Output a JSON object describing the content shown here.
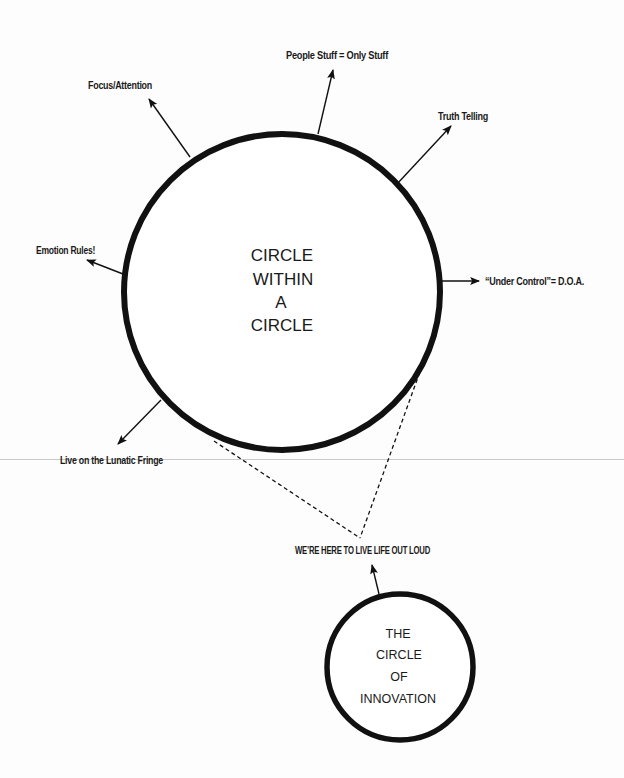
{
  "diagram": {
    "colors": {
      "ink": "#111111",
      "background": "#fdfdfd",
      "scan_line": "#c9c9c9"
    },
    "main_circle": {
      "lines": [
        "CIRCLE",
        "WITHIN",
        "A",
        "CIRCLE"
      ],
      "cx": 282,
      "cy": 292,
      "r": 158
    },
    "outer_labels": [
      {
        "id": "focus",
        "text": "Focus/Attention"
      },
      {
        "id": "people",
        "text": "People Stuff = Only Stuff"
      },
      {
        "id": "truth",
        "text": "Truth Telling"
      },
      {
        "id": "emotion",
        "text": "Emotion Rules!"
      },
      {
        "id": "control",
        "text": "“Under Control”= D.O.A."
      },
      {
        "id": "fringe",
        "text": "Live on the Lunatic Fringe"
      }
    ],
    "connector_label": "WE’RE HERE TO LIVE LIFE OUT LOUD",
    "small_circle": {
      "lines": [
        "THE",
        "CIRCLE",
        "OF",
        "INNOVATION"
      ],
      "cx": 400,
      "cy": 667,
      "r": 73
    }
  }
}
